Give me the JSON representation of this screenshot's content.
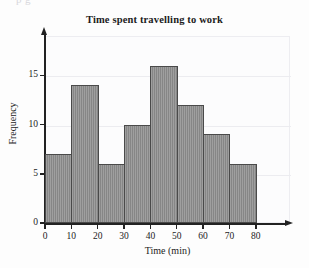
{
  "page": {
    "bleed_text": "p                g"
  },
  "chart_data": {
    "type": "bar",
    "title": "Time spent travelling to work",
    "xlabel": "Time (min)",
    "ylabel": "Frequency",
    "categories": [
      "0-10",
      "10-20",
      "20-30",
      "30-40",
      "40-50",
      "50-60",
      "60-70",
      "70-80"
    ],
    "bin_edges": [
      0,
      10,
      20,
      30,
      40,
      50,
      60,
      70,
      80
    ],
    "values": [
      7,
      14,
      6,
      10,
      16,
      12,
      9,
      6
    ],
    "xlim": [
      0,
      80
    ],
    "ylim": [
      0,
      19
    ],
    "xticks": [
      0,
      10,
      20,
      30,
      40,
      50,
      60,
      70,
      80
    ],
    "xtick_labels": [
      "0",
      "10",
      "20",
      "30",
      "40",
      "50",
      "60",
      "70",
      "80"
    ],
    "yticks": [
      0,
      5,
      10,
      15
    ],
    "ytick_labels": [
      "0",
      "5",
      "10",
      "15"
    ],
    "gridlines": [
      5,
      10,
      15
    ],
    "grid": true,
    "legend": null,
    "bar_color": "#8d8d8d",
    "bar_edge_color": "#4a4a4a",
    "axis_color": "#222222",
    "background_color": "#fcfcfd"
  }
}
